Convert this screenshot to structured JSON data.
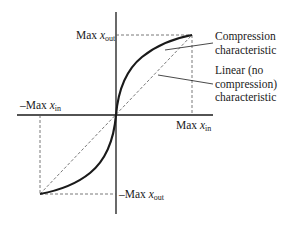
{
  "diagram": {
    "type": "transfer-characteristic",
    "axes": {
      "x_positive_label": {
        "prefix": "Max ",
        "var": "x",
        "sub": "in"
      },
      "x_negative_label": {
        "prefix": "–Max ",
        "var": "x",
        "sub": "in"
      },
      "y_positive_label": {
        "prefix": "Max ",
        "var": "x",
        "sub": "out"
      },
      "y_negative_label": {
        "prefix": "–Max ",
        "var": "x",
        "sub": "out"
      }
    },
    "annotations": {
      "compression": {
        "line1": "Compression",
        "line2": "characteristic"
      },
      "linear": {
        "line1": "Linear (no",
        "line2": "compression)",
        "line3": "characteristic"
      }
    },
    "curves": [
      {
        "name": "Compression characteristic",
        "style": "solid-thick"
      },
      {
        "name": "Linear (no compression) characteristic",
        "style": "dashed-thin"
      }
    ],
    "colors": {
      "ink": "#1a1a1a",
      "dashed": "#555555",
      "background": "#ffffff"
    }
  }
}
